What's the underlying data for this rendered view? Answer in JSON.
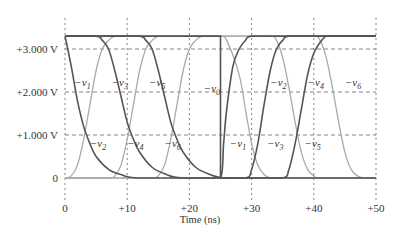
{
  "chart_data": {
    "type": "line",
    "title": "",
    "xlabel": "Time (ns)",
    "ylabel": "",
    "xlim": [
      0,
      50
    ],
    "ylim": [
      0,
      3.3
    ],
    "grid": true,
    "legend": "inline labels on curves",
    "x_ticks": [
      {
        "value": 0,
        "label": "0"
      },
      {
        "value": 10,
        "label": "+10"
      },
      {
        "value": 20,
        "label": "+20"
      },
      {
        "value": 30,
        "label": "+30"
      },
      {
        "value": 40,
        "label": "+40"
      },
      {
        "value": 50,
        "label": "+50"
      }
    ],
    "y_ticks": [
      {
        "value": 0,
        "label": "0"
      },
      {
        "value": 1,
        "label": "+1.000 V"
      },
      {
        "value": 2,
        "label": "+2.000 V"
      },
      {
        "value": 3,
        "label": "+3.000 V"
      }
    ],
    "series": [
      {
        "name": "v0",
        "label": "−v0",
        "color": "#555555",
        "x": [
          0,
          25,
          25,
          50
        ],
        "y": [
          3.3,
          3.3,
          0,
          0
        ],
        "label_pos": {
          "x": 22.3,
          "y": 2.0
        }
      },
      {
        "name": "v1",
        "label": "−v1",
        "color": "#555555",
        "x": [
          0,
          1,
          2,
          3,
          4,
          5,
          7,
          9,
          12,
          25,
          25.5,
          26,
          27,
          28,
          29,
          30,
          50
        ],
        "y": [
          3.3,
          2.6,
          1.8,
          1.2,
          0.8,
          0.5,
          0.2,
          0.08,
          0.0,
          0.0,
          0.8,
          1.6,
          2.6,
          3.0,
          3.2,
          3.3,
          3.3
        ],
        "label_pos": {
          "x": 1.5,
          "y": 2.15
        }
      },
      {
        "name": "v2",
        "label": "−v2",
        "color": "#aaaaaa",
        "x": [
          0,
          1,
          2,
          3,
          4,
          5,
          6,
          7,
          8,
          9,
          10,
          25,
          26,
          28,
          29,
          30,
          31,
          32,
          33,
          35,
          50
        ],
        "y": [
          0,
          0.05,
          0.3,
          0.9,
          1.7,
          2.5,
          3.0,
          3.2,
          3.3,
          3.3,
          3.3,
          3.3,
          3.2,
          2.4,
          1.6,
          0.8,
          0.3,
          0.08,
          0.0,
          0.0,
          0
        ],
        "label_pos": {
          "x": 4.0,
          "y": 0.72
        }
      },
      {
        "name": "v3",
        "label": "−v3",
        "color": "#555555",
        "x": [
          0,
          5,
          6,
          7,
          8,
          9,
          10,
          11,
          12,
          14,
          16,
          19,
          29,
          30,
          31,
          32,
          33,
          34,
          35,
          36,
          50
        ],
        "y": [
          3.3,
          3.3,
          3.2,
          3.0,
          2.5,
          1.9,
          1.3,
          0.9,
          0.6,
          0.25,
          0.1,
          0.0,
          0.0,
          0.2,
          0.8,
          1.7,
          2.5,
          3.0,
          3.2,
          3.3,
          3.3
        ],
        "label_pos": {
          "x": 7.5,
          "y": 2.15
        }
      },
      {
        "name": "v4",
        "label": "−v4",
        "color": "#aaaaaa",
        "x": [
          0,
          7,
          8,
          9,
          10,
          11,
          12,
          13,
          14,
          15,
          16,
          33,
          34,
          35,
          36,
          37,
          38,
          39,
          40,
          41,
          50
        ],
        "y": [
          0,
          0,
          0.05,
          0.3,
          0.9,
          1.7,
          2.5,
          3.0,
          3.2,
          3.3,
          3.3,
          3.3,
          3.2,
          2.8,
          2.1,
          1.3,
          0.6,
          0.2,
          0.05,
          0,
          0
        ],
        "label_pos": {
          "x": 10.0,
          "y": 0.72
        }
      },
      {
        "name": "v5",
        "label": "−v5",
        "color": "#555555",
        "x": [
          0,
          12,
          13,
          14,
          15,
          16,
          17,
          18,
          19,
          21,
          23,
          26,
          35,
          36,
          37,
          38,
          39,
          40,
          41,
          42,
          43,
          50
        ],
        "y": [
          3.3,
          3.3,
          3.2,
          3.0,
          2.5,
          1.9,
          1.3,
          0.9,
          0.6,
          0.25,
          0.1,
          0.0,
          0.0,
          0.2,
          0.8,
          1.6,
          2.4,
          2.9,
          3.15,
          3.3,
          3.3,
          3.3
        ],
        "label_pos": {
          "x": 13.5,
          "y": 2.15
        }
      },
      {
        "name": "v6",
        "label": "−v6",
        "color": "#aaaaaa",
        "x": [
          0,
          14,
          15,
          16,
          17,
          18,
          19,
          20,
          21,
          22,
          23,
          40,
          41,
          42,
          43,
          44,
          45,
          46,
          47,
          48,
          50
        ],
        "y": [
          0,
          0,
          0.05,
          0.3,
          0.9,
          1.7,
          2.5,
          3.0,
          3.2,
          3.3,
          3.3,
          3.3,
          3.2,
          2.8,
          2.1,
          1.3,
          0.6,
          0.2,
          0.05,
          0,
          0
        ],
        "label_pos": {
          "x": 16.0,
          "y": 0.72
        }
      }
    ],
    "extra_labels": [
      {
        "text": "−v2",
        "x": 33.0,
        "y": 2.15
      },
      {
        "text": "−v4",
        "x": 39.0,
        "y": 2.15
      },
      {
        "text": "−v6",
        "x": 45.0,
        "y": 2.15
      },
      {
        "text": "−v1",
        "x": 26.5,
        "y": 0.72
      },
      {
        "text": "−v3",
        "x": 32.5,
        "y": 0.72
      },
      {
        "text": "−v5",
        "x": 38.5,
        "y": 0.72
      }
    ]
  }
}
